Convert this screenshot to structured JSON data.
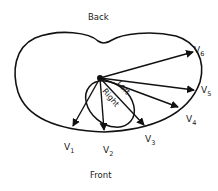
{
  "labels": {
    "back": "Back",
    "front": "Front",
    "left": "Left",
    "right": "Right"
  },
  "leads": [
    {
      "name": "V",
      "sub": "1"
    },
    {
      "name": "V",
      "sub": "2"
    },
    {
      "name": "V",
      "sub": "3"
    },
    {
      "name": "V",
      "sub": "4"
    },
    {
      "name": "V",
      "sub": "5"
    },
    {
      "name": "V",
      "sub": "6"
    }
  ],
  "colors": {
    "stroke": "#111111",
    "background": "#ffffff"
  }
}
